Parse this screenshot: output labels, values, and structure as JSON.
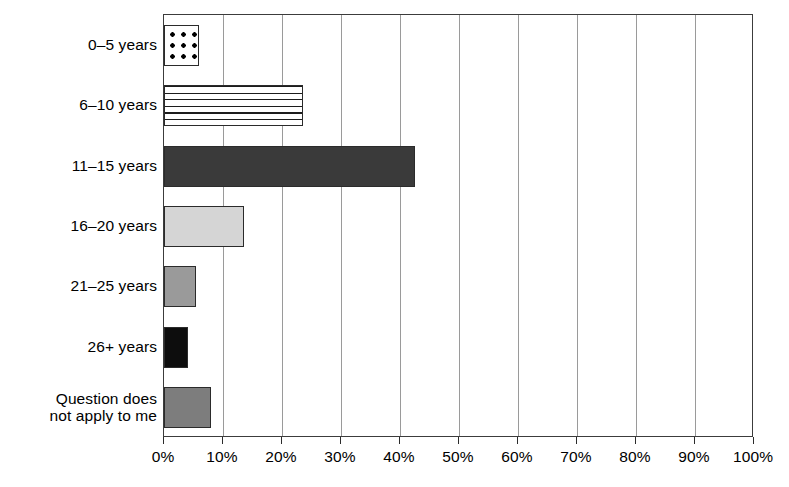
{
  "chart_data": {
    "type": "bar",
    "orientation": "horizontal",
    "title": "",
    "xlabel": "",
    "ylabel": "",
    "xlim": [
      0,
      100
    ],
    "xtick_step": 10,
    "grid": "vertical",
    "legend": "none",
    "categories": [
      "0–5 years",
      "6–10 years",
      "11–15 years",
      "16–20 years",
      "21–25 years",
      "26+ years",
      "Question does not apply to me"
    ],
    "values": [
      6,
      23.5,
      42.5,
      13.5,
      5.5,
      4,
      8
    ],
    "value_unit": "%",
    "xticklabels": [
      "0%",
      "10%",
      "20%",
      "30%",
      "40%",
      "50%",
      "60%",
      "70%",
      "80%",
      "90%",
      "100%"
    ],
    "bar_styles": [
      {
        "pattern": "dots",
        "fill": "#ffffff",
        "pattern_color": "#000000",
        "edge": "#2b2b2b"
      },
      {
        "pattern": "hlines",
        "fill": "#ffffff",
        "pattern_color": "#1c1c1c",
        "edge": "#2b2b2b"
      },
      {
        "pattern": "solid",
        "fill": "#3a3a3a",
        "pattern_color": "#3a3a3a",
        "edge": "#2b2b2b"
      },
      {
        "pattern": "solid",
        "fill": "#d5d5d5",
        "pattern_color": "#d5d5d5",
        "edge": "#2b2b2b"
      },
      {
        "pattern": "solid",
        "fill": "#9a9a9a",
        "pattern_color": "#9a9a9a",
        "edge": "#2b2b2b"
      },
      {
        "pattern": "solid",
        "fill": "#0d0d0d",
        "pattern_color": "#0d0d0d",
        "edge": "#2b2b2b"
      },
      {
        "pattern": "solid",
        "fill": "#7d7d7d",
        "pattern_color": "#7d7d7d",
        "edge": "#2b2b2b"
      }
    ]
  },
  "category_labels": [
    {
      "lines": [
        "0–5 years"
      ]
    },
    {
      "lines": [
        "6–10 years"
      ]
    },
    {
      "lines": [
        "11–15 years"
      ]
    },
    {
      "lines": [
        "16–20 years"
      ]
    },
    {
      "lines": [
        "21–25 years"
      ]
    },
    {
      "lines": [
        "26+ years"
      ]
    },
    {
      "lines": [
        "Question does",
        "not apply to me"
      ]
    }
  ],
  "colors": {
    "axis": "#2b2b2b",
    "gridline": "#9a9a9a",
    "background": "#ffffff",
    "text": "#000000"
  }
}
